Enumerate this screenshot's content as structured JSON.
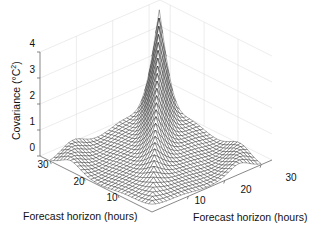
{
  "chart_data": {
    "type": "surface-mesh",
    "title": "",
    "zlabel": "Covariance (°C²)",
    "zlabel_text": "Covariance (°C",
    "zlabel_sup": "2",
    "zlabel_close": ")",
    "xlabel": "Forecast horizon (hours)",
    "ylabel": "Forecast horizon (hours)",
    "x_ticks": [
      "10",
      "20",
      "30"
    ],
    "y_ticks": [
      "10",
      "20",
      "30"
    ],
    "z_ticks": [
      "0",
      "1",
      "2",
      "3",
      "4"
    ],
    "x_range": [
      0,
      33
    ],
    "y_range": [
      0,
      33
    ],
    "z_range": [
      0,
      4
    ],
    "grid": true,
    "mesh_color": "#000000",
    "surface_description": "Symmetric covariance of forecast errors; ridge along diagonal rising to ~4 at (30,30); off-diagonal oscillations with troughs near 0 and small bumps ~0.5-1 near edges",
    "sample_points": [
      {
        "h1": 0,
        "h2": 0,
        "cov": 0.3
      },
      {
        "h1": 10,
        "h2": 10,
        "cov": 1.2
      },
      {
        "h1": 20,
        "h2": 20,
        "cov": 2.4
      },
      {
        "h1": 30,
        "h2": 30,
        "cov": 4.0
      },
      {
        "h1": 30,
        "h2": 0,
        "cov": 0.0
      },
      {
        "h1": 0,
        "h2": 30,
        "cov": 0.0
      },
      {
        "h1": 30,
        "h2": 15,
        "cov": 0.8
      },
      {
        "h1": 15,
        "h2": 30,
        "cov": 0.8
      }
    ]
  }
}
